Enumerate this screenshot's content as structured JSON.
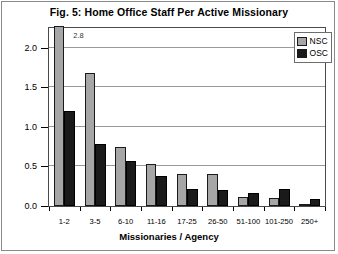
{
  "chart_data": {
    "type": "bar",
    "title": "Fig. 5:  Home Office Staff Per Active Missionary",
    "xlabel": "Missionaries / Agency",
    "ylabel": "",
    "categories": [
      "1-2",
      "3-5",
      "6-10",
      "11-16",
      "17-25",
      "26-50",
      "51-100",
      "101-250",
      "250+"
    ],
    "series": [
      {
        "name": "NSC",
        "color": "#a6a6a6",
        "values": [
          2.8,
          1.68,
          0.75,
          0.53,
          0.41,
          0.41,
          0.11,
          0.1,
          0.02
        ]
      },
      {
        "name": "OSC",
        "color": "#1a1a1a",
        "values": [
          1.2,
          0.79,
          0.57,
          0.38,
          0.22,
          0.2,
          0.17,
          0.21,
          0.09
        ]
      }
    ],
    "ylim": [
      0.0,
      2.25
    ],
    "yticks": [
      0.0,
      0.5,
      1.0,
      1.5,
      2.0
    ],
    "ytick_labels": [
      "0.0",
      "0.5",
      "1.0",
      "1.5",
      "2.0"
    ],
    "grid": true,
    "legend_position": "top-right",
    "annotations": [
      {
        "text": "2.8",
        "series": "NSC",
        "category": "1-2",
        "note": "value label for bar clipped by axis maximum"
      }
    ]
  },
  "legend": {
    "entries": [
      {
        "label": "NSC"
      },
      {
        "label": "OSC"
      }
    ]
  }
}
